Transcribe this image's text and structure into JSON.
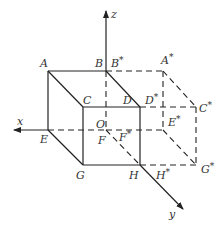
{
  "figure": {
    "title": "",
    "axes": [
      {
        "id": "x",
        "label": "x"
      },
      {
        "id": "y",
        "label": "y"
      },
      {
        "id": "z",
        "label": "z"
      }
    ],
    "origin_label": "O",
    "cube_vertices": [
      {
        "id": "A",
        "label": "A"
      },
      {
        "id": "B",
        "label": "B"
      },
      {
        "id": "C",
        "label": "C"
      },
      {
        "id": "D",
        "label": "D"
      },
      {
        "id": "E",
        "label": "E"
      },
      {
        "id": "F",
        "label": "F"
      },
      {
        "id": "G",
        "label": "G"
      },
      {
        "id": "H",
        "label": "H"
      }
    ],
    "image_vertices": [
      {
        "id": "A*",
        "base": "A",
        "star": "*"
      },
      {
        "id": "B*",
        "base": "B",
        "star": "*"
      },
      {
        "id": "C*",
        "base": "C",
        "star": "*"
      },
      {
        "id": "D*",
        "base": "D",
        "star": "*"
      },
      {
        "id": "E*",
        "base": "E",
        "star": "*"
      },
      {
        "id": "F*",
        "base": "F",
        "star": "*"
      },
      {
        "id": "G*",
        "base": "G",
        "star": "*"
      },
      {
        "id": "H*",
        "base": "H",
        "star": "*"
      }
    ],
    "solid_edges": [
      "A-B",
      "A-C",
      "A-E",
      "B-D",
      "C-D",
      "C-G",
      "D-H",
      "E-G",
      "G-H"
    ],
    "dashed_edges": [
      "B-A*",
      "A*-C*",
      "A*-E*",
      "D-C*",
      "C*-G*",
      "F-E*",
      "E*-G*",
      "H-G*",
      "B-F",
      "F-H"
    ],
    "colors": {
      "line": "#222222",
      "text": "#333333",
      "background": "#ffffff"
    }
  }
}
